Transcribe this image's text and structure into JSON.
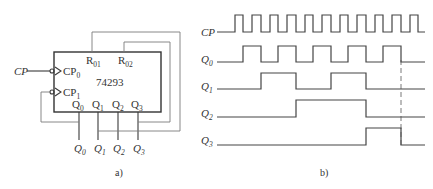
{
  "figure_a": {
    "caption": "a)",
    "chip": {
      "part_number": "74293",
      "pins": {
        "r01": {
          "base": "R",
          "sub": "01"
        },
        "r02": {
          "base": "R",
          "sub": "02"
        },
        "cp0": {
          "base": "CP",
          "sub": "0"
        },
        "cp1": {
          "base": "CP",
          "sub": "1"
        },
        "q0": {
          "base": "Q",
          "sub": "0"
        },
        "q1": {
          "base": "Q",
          "sub": "1"
        },
        "q2": {
          "base": "Q",
          "sub": "2"
        },
        "q3": {
          "base": "Q",
          "sub": "3"
        }
      }
    },
    "input_label": "CP",
    "outputs": [
      {
        "base": "Q",
        "sub": "0"
      },
      {
        "base": "Q",
        "sub": "1"
      },
      {
        "base": "Q",
        "sub": "2"
      },
      {
        "base": "Q",
        "sub": "3"
      }
    ],
    "connections": [
      "CP -> CP0",
      "Q0 -> CP1",
      "Q1 -> R01",
      "Q3 -> R02"
    ]
  },
  "figure_b": {
    "caption": "b)",
    "signals": [
      {
        "name": "CP",
        "base": "CP",
        "sub": ""
      },
      {
        "name": "Q0",
        "base": "Q",
        "sub": "0"
      },
      {
        "name": "Q1",
        "base": "Q",
        "sub": "1"
      },
      {
        "name": "Q2",
        "base": "Q",
        "sub": "2"
      },
      {
        "name": "Q3",
        "base": "Q",
        "sub": "3"
      }
    ],
    "cp_pulse_count": 11,
    "state_sequence": [
      0,
      1,
      2,
      3,
      4,
      5,
      6,
      7,
      8,
      9,
      0
    ],
    "reset_marker": "dashed line at transition to state 10 (Q3=1,Q1=1 -> reset)"
  }
}
